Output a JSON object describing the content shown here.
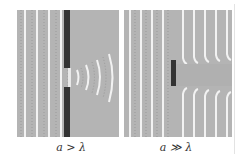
{
  "figure": {
    "panels": [
      {
        "id": "left",
        "caption": "a > λ",
        "description": "Plane waves through a narrow aperture diffract into curved wavefronts",
        "wavefront_spacing_px": 12,
        "barrier": "wall with aperture",
        "colors": {
          "background": "#b4b4b4",
          "wavefront": "#f4f4f4",
          "barrier": "#3a3a3a"
        }
      },
      {
        "id": "right",
        "caption": "a ≫ λ",
        "description": "Plane waves pass a small obstacle with little diffraction, leaving a shadow",
        "wavefront_spacing_px": 11,
        "barrier": "small obstacle",
        "colors": {
          "background": "#b4b4b4",
          "wavefront": "#f4f4f4",
          "barrier": "#3a3a3a"
        }
      }
    ]
  }
}
